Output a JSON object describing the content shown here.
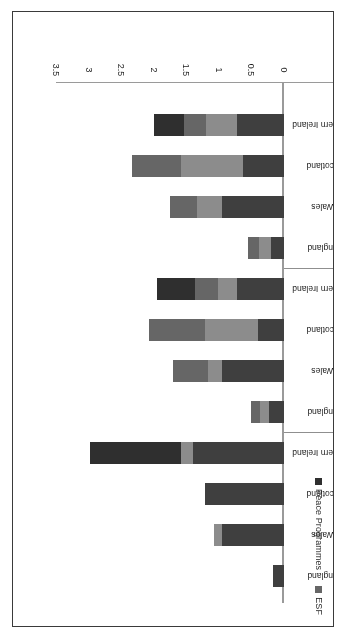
{
  "figure": {
    "border_color": "#3a3a3a",
    "background": "#ffffff",
    "orientation": "rotated-180"
  },
  "chart_data": {
    "type": "bar",
    "orientation": "horizontal-stacked",
    "title": "",
    "subtitle": "",
    "xlabel": "",
    "ylabel": "",
    "xlim": [
      0,
      3.5
    ],
    "grid": false,
    "legend_position": "left",
    "tick_labels": [
      "0",
      "0.5",
      "1",
      "1.5",
      "2",
      "2.5",
      "3",
      "3.5"
    ],
    "tick_values": [
      0,
      0.5,
      1,
      1.5,
      2,
      2.5,
      3,
      3.5
    ],
    "group_label_key": "period",
    "groups": [
      {
        "period": "2000-2006",
        "categories": [
          "England",
          "Wales",
          "Scotland",
          "Northern Ireland"
        ]
      },
      {
        "period": "2007-2013",
        "categories": [
          "England",
          "Wales",
          "Scotland",
          "Northern Ireland"
        ]
      },
      {
        "period": "2014-2020",
        "categories": [
          "England",
          "Wales",
          "Scotland",
          "Northern Ireland"
        ]
      }
    ],
    "series": [
      {
        "name": "ERDF",
        "color": "#3f3f3f"
      },
      {
        "name": "EAFRD",
        "color": "#8c8c8c"
      },
      {
        "name": "ESF",
        "color": "#666666"
      },
      {
        "name": "Peace Programmes",
        "color": "#2f2f2f"
      }
    ],
    "bars": [
      {
        "period": "2000-2006",
        "category": "England",
        "segments": [
          0.17,
          0.0,
          0.0,
          0.0
        ],
        "total": 0.17
      },
      {
        "period": "2000-2006",
        "category": "Wales",
        "segments": [
          0.95,
          0.12,
          0.0,
          0.0
        ],
        "total": 1.07
      },
      {
        "period": "2000-2006",
        "category": "Scotland",
        "segments": [
          1.22,
          0.0,
          0.0,
          0.0
        ],
        "total": 1.22
      },
      {
        "period": "2000-2006",
        "category": "Northern Ireland",
        "segments": [
          1.4,
          0.18,
          0.0,
          1.4
        ],
        "total": 2.98
      },
      {
        "period": "2007-2013",
        "category": "England",
        "segments": [
          0.23,
          0.14,
          0.13,
          0.0
        ],
        "total": 0.5
      },
      {
        "period": "2007-2013",
        "category": "Wales",
        "segments": [
          0.95,
          0.22,
          0.53,
          0.0
        ],
        "total": 1.7
      },
      {
        "period": "2007-2013",
        "category": "Scotland",
        "segments": [
          0.4,
          0.82,
          0.86,
          0.0
        ],
        "total": 2.08
      },
      {
        "period": "2007-2013",
        "category": "Northern Ireland",
        "segments": [
          0.72,
          0.3,
          0.35,
          0.58
        ],
        "total": 1.95
      },
      {
        "period": "2014-2020",
        "category": "England",
        "segments": [
          0.2,
          0.18,
          0.17,
          0.0
        ],
        "total": 0.55
      },
      {
        "period": "2014-2020",
        "category": "Wales",
        "segments": [
          0.95,
          0.38,
          0.42,
          0.0
        ],
        "total": 1.75
      },
      {
        "period": "2014-2020",
        "category": "Scotland",
        "segments": [
          0.63,
          0.95,
          0.75,
          0.0
        ],
        "total": 2.33
      },
      {
        "period": "2014-2020",
        "category": "Northern Ireland",
        "segments": [
          0.72,
          0.48,
          0.34,
          0.46
        ],
        "total": 2.0
      }
    ]
  }
}
